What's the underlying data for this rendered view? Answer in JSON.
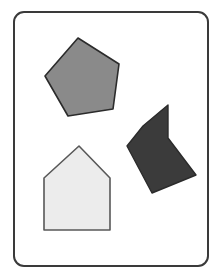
{
  "figure": {
    "canvas": {
      "width": 221,
      "height": 278,
      "background_color": "#ffffff"
    },
    "frame": {
      "label": "rounded-rectangle-frame",
      "x": 14,
      "y": 12,
      "width": 194,
      "height": 254,
      "corner_radius": 10,
      "fill_color": "#ffffff",
      "stroke_color": "#3a3a3a",
      "stroke_width": 2
    },
    "shapes": [
      {
        "id": "gray-pentagon",
        "name": "pentagon",
        "sides": 5,
        "fill_color": "#8a8a8a",
        "stroke_color": "#2b2b2b",
        "stroke_width": 1.6,
        "points": "78,38 119,64 113,109 68,116 45,76"
      },
      {
        "id": "dark-arrow",
        "name": "concave-arrow-polygon",
        "sides": 6,
        "fill_color": "#3b3b3b",
        "stroke_color": "#2b2b2b",
        "stroke_width": 1.4,
        "points": "168,105 168,138 196,175 152,193 127,146 143,126"
      },
      {
        "id": "light-house",
        "name": "house-pentagon",
        "sides": 5,
        "fill_color": "#ececec",
        "stroke_color": "#585858",
        "stroke_width": 1.6,
        "points": "79,146 110,178 110,230 44,230 44,178"
      }
    ]
  }
}
